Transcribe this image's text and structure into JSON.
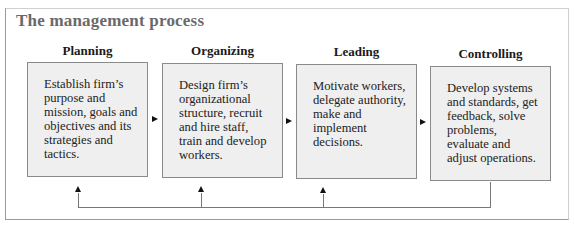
{
  "title": "The management process",
  "stages": [
    {
      "heading": "Planning",
      "text": "Establish firm’s purpose and mission, goals and objectives and its strategies and tactics."
    },
    {
      "heading": "Organizing",
      "text": "Design firm’s organizational structure, recruit and hire staff, train and develop workers."
    },
    {
      "heading": "Leading",
      "text": "Motivate workers, delegate authority, make and implement decisions."
    },
    {
      "heading": "Controlling",
      "text": "Develop systems and standards, get feedback, solve problems, evaluate and adjust operations."
    }
  ],
  "connectors": {
    "forward_arrows": 3,
    "feedback_loop": "from Controlling back to Planning, Organizing and Leading"
  }
}
